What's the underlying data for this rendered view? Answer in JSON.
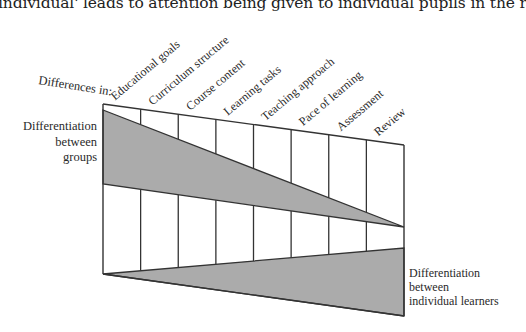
{
  "caption": "individual' leads to attention being given to individual pupils in the review of their work.",
  "diagram": {
    "axis_prefix": "Differences in:",
    "columns": [
      "Educational goals",
      "Curriculum structure",
      "Course content",
      "Learning tasks",
      "Teaching approach",
      "Pace of learning",
      "Assessment",
      "Review"
    ],
    "upper_region": {
      "label_lines": [
        "Differentiation",
        "between",
        "groups"
      ],
      "trend": "decreasing from left to right"
    },
    "lower_region": {
      "label_lines": [
        "Differentiation",
        "between",
        "individual learners"
      ],
      "trend": "increasing from left to right"
    },
    "colors": {
      "shade": "#ababab",
      "line": "#333333"
    }
  }
}
